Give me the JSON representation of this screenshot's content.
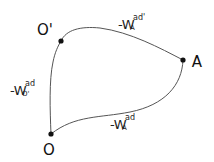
{
  "diagram": {
    "points": [
      {
        "id": "O-prime",
        "label": "O'",
        "x": 61,
        "y": 41,
        "label_x": 45,
        "label_y": 30
      },
      {
        "id": "A",
        "label": "A",
        "x": 183,
        "y": 60,
        "label_x": 197,
        "label_y": 62
      },
      {
        "id": "O",
        "label": "O",
        "x": 51,
        "y": 134,
        "label_x": 49,
        "label_y": 150
      }
    ],
    "edges": [
      {
        "from": "O-prime",
        "to": "A",
        "label": {
          "prefix": "-W",
          "sup": "ad'",
          "sub": "A"
        }
      },
      {
        "from": "A",
        "to": "O",
        "label": {
          "prefix": "-W",
          "sup": "ad",
          "sub": "A"
        }
      },
      {
        "from": "O",
        "to": "O-prime",
        "label": {
          "prefix": "-W",
          "sup": "ad",
          "sub": "O'"
        }
      }
    ],
    "colors": {
      "line": "#555555",
      "dot": "#111111",
      "text": "#111111"
    }
  }
}
